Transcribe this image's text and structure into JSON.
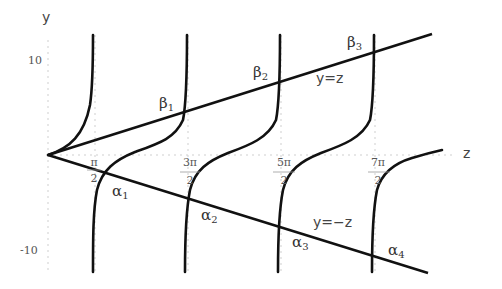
{
  "axes": {
    "x_label": "z",
    "y_label": "y",
    "y_ticks": [
      "10",
      "-10"
    ],
    "x_ticks": [
      {
        "num": "π",
        "den": "2"
      },
      {
        "num": "3π",
        "den": "2"
      },
      {
        "num": "5π",
        "den": "2"
      },
      {
        "num": "7π",
        "den": "2"
      }
    ]
  },
  "lines": {
    "upper": "y=z",
    "lower": "y=−z"
  },
  "intersections": {
    "beta": [
      {
        "sym": "β",
        "sub": "1"
      },
      {
        "sym": "β",
        "sub": "2"
      },
      {
        "sym": "β",
        "sub": "3"
      }
    ],
    "alpha": [
      {
        "sym": "α",
        "sub": "1"
      },
      {
        "sym": "α",
        "sub": "2"
      },
      {
        "sym": "α",
        "sub": "3"
      },
      {
        "sym": "α",
        "sub": "4"
      }
    ]
  },
  "colors": {
    "curve": "#111111",
    "grid": "#cccccc",
    "text": "#444444"
  }
}
